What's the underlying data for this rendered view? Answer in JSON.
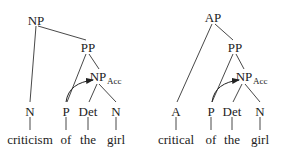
{
  "trees": [
    {
      "name": "noun-phrase-tree",
      "nodes": {
        "root": "NP",
        "pp": "PP",
        "np_obj": "NP",
        "np_obj_case": "Acc",
        "head": "N",
        "p": "P",
        "det": "Det",
        "n": "N"
      },
      "words": [
        "criticism",
        "of",
        "the",
        "girl"
      ]
    },
    {
      "name": "adjective-phrase-tree",
      "nodes": {
        "root": "AP",
        "pp": "PP",
        "np_obj": "NP",
        "np_obj_case": "Acc",
        "head": "A",
        "p": "P",
        "det": "Det",
        "n": "N"
      },
      "words": [
        "critical",
        "of",
        "the",
        "girl"
      ]
    }
  ],
  "colors": {
    "text": "#222222",
    "lines": "#333333",
    "background": "#ffffff"
  }
}
